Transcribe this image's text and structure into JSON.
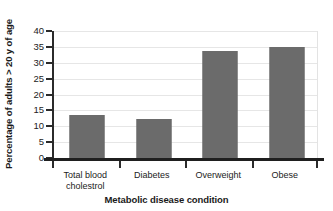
{
  "chart_data": {
    "type": "bar",
    "title": "",
    "categories": [
      "Total blood cholestrol",
      "Diabetes",
      "Overweight",
      "Obese"
    ],
    "category_lines": [
      [
        "Total blood",
        "cholestrol"
      ],
      [
        "Diabetes"
      ],
      [
        "Overweight"
      ],
      [
        "Obese"
      ]
    ],
    "values": [
      13.4,
      12.3,
      33.6,
      34.9
    ],
    "xlabel": "Metabolic disease condition",
    "ylabel": "Percentage of adults > 20 y of age",
    "ylim": [
      0,
      40
    ],
    "yticks": [
      0,
      5,
      10,
      15,
      20,
      25,
      30,
      35,
      40
    ],
    "ytick_labels": [
      "0",
      "5",
      "10",
      "15",
      "20",
      "25",
      "30",
      "35",
      "40"
    ],
    "grid": true,
    "grid_axis": "y",
    "legend": false,
    "bar_color": "#6b6b6b",
    "grid_color": "#e6e6e6",
    "axis_color": "#1f1f1f",
    "background": "#ffffff"
  }
}
